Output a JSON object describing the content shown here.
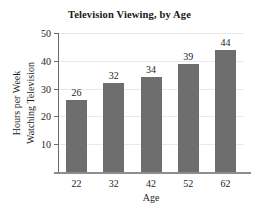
{
  "chart_data": {
    "type": "bar",
    "title": "Television Viewing, by Age",
    "xlabel": "Age",
    "ylabel": "Hours per Week Watching Television",
    "ylabel_lines": [
      "Hours per Week",
      "Watching Television"
    ],
    "categories": [
      "22",
      "32",
      "42",
      "52",
      "62"
    ],
    "values": [
      26,
      32,
      34,
      39,
      44
    ],
    "value_labels": [
      "26",
      "32",
      "34",
      "39",
      "44"
    ],
    "ylim": [
      0,
      50
    ],
    "yticks": [
      10,
      20,
      30,
      40,
      50
    ],
    "ytick_labels": [
      "10",
      "20",
      "30",
      "40",
      "50"
    ],
    "grid": true,
    "legend": false,
    "bar_color": "#6e6e6e",
    "grid_color": "#e9e9e9",
    "axis_color": "#6a6a6a",
    "text_color": "#1d1d1d",
    "background": "#ffffff"
  }
}
